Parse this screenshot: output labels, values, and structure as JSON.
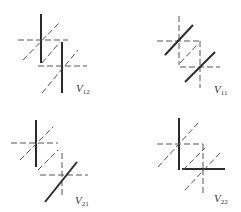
{
  "figure": {
    "panels": [
      {
        "id": "V12",
        "label_main": "V",
        "label_sub": "12",
        "position": "top-left"
      },
      {
        "id": "V11",
        "label_main": "V",
        "label_sub": "11",
        "position": "top-right"
      },
      {
        "id": "V21",
        "label_main": "V",
        "label_sub": "21",
        "position": "bottom-left"
      },
      {
        "id": "V22",
        "label_main": "V",
        "label_sub": "22",
        "position": "bottom-right"
      }
    ],
    "colors": {
      "solid_line": "#2b2b2b",
      "dashed_line": "#555555",
      "background": "#ffffff"
    }
  }
}
